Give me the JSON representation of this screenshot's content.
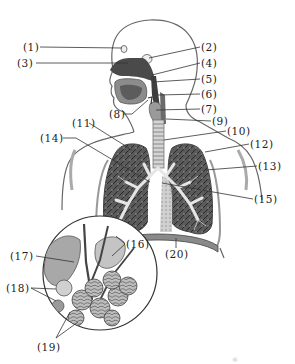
{
  "diagram": {
    "colors": {
      "outline": "#555555",
      "dark_tissue": "#4a4a4a",
      "mid_tissue": "#8a8a8a",
      "light_tissue": "#c8c8c8",
      "leader_line": "#333333",
      "background": "#ffffff"
    },
    "labels": [
      {
        "id": 1,
        "text": "(1)",
        "x": 23,
        "y": 41
      },
      {
        "id": 2,
        "text": "(2)",
        "x": 201,
        "y": 41
      },
      {
        "id": 3,
        "text": "(3)",
        "x": 17,
        "y": 57
      },
      {
        "id": 4,
        "text": "(4)",
        "x": 201,
        "y": 57
      },
      {
        "id": 5,
        "text": "(5)",
        "x": 201,
        "y": 73
      },
      {
        "id": 6,
        "text": "(6)",
        "x": 201,
        "y": 88
      },
      {
        "id": 7,
        "text": "(7)",
        "x": 201,
        "y": 103
      },
      {
        "id": 8,
        "text": "(8)",
        "x": 109,
        "y": 108
      },
      {
        "id": 9,
        "text": "(9)",
        "x": 212,
        "y": 115
      },
      {
        "id": 10,
        "text": "(10)",
        "x": 227,
        "y": 125
      },
      {
        "id": 11,
        "text": "(11)",
        "x": 72,
        "y": 117
      },
      {
        "id": 12,
        "text": "(12)",
        "x": 250,
        "y": 138
      },
      {
        "id": 13,
        "text": "(13)",
        "x": 258,
        "y": 160
      },
      {
        "id": 14,
        "text": "(14)",
        "x": 46,
        "y": 132
      },
      {
        "id": 15,
        "text": "(15)",
        "x": 254,
        "y": 193
      },
      {
        "id": 16,
        "text": "(16)",
        "x": 126,
        "y": 238
      },
      {
        "id": 17,
        "text": "(17)",
        "x": 10,
        "y": 250
      },
      {
        "id": 18,
        "text": "(18)",
        "x": 14,
        "y": 282
      },
      {
        "id": 19,
        "text": "(19)",
        "x": 37,
        "y": 341
      },
      {
        "id": 20,
        "text": "(20)",
        "x": 165,
        "y": 248
      }
    ],
    "inset": {
      "name": "alveoli-magnified-view",
      "cx": 100,
      "cy": 273,
      "r": 57
    }
  }
}
